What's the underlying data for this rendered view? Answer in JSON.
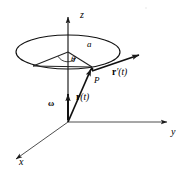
{
  "figure": {
    "background_color": "#ffffff",
    "stroke_color": "#1a1a1a",
    "axes": [
      {
        "key": "z",
        "label": "z",
        "direction": "up",
        "label_x": 80,
        "label_y": 10
      },
      {
        "key": "y",
        "label": "y",
        "direction": "right",
        "label_x": 171,
        "label_y": 127
      },
      {
        "key": "x",
        "label": "x",
        "direction": "lower-left",
        "label_x": 19,
        "label_y": 157
      }
    ],
    "labels": {
      "radius": "a",
      "angle": "θ",
      "point": "P",
      "angular_velocity": "ω",
      "position_vector_bold": "r",
      "position_vector_arg": "(t)",
      "velocity_vector_bold": "r",
      "velocity_vector_prime": "′",
      "velocity_vector_arg": "(t)"
    },
    "label_positions": {
      "radius": {
        "x": 87,
        "y": 44
      },
      "angle": {
        "x": 72,
        "y": 57
      },
      "point": {
        "x": 95,
        "y": 80
      },
      "angular_velocity": {
        "x": 48,
        "y": 101
      },
      "position_vector": {
        "x": 77,
        "y": 96
      },
      "velocity_vector": {
        "x": 113,
        "y": 70
      }
    },
    "geometry": {
      "origin": {
        "x": 68,
        "y": 122
      },
      "circle_center": {
        "x": 68,
        "y": 52
      },
      "circle_rx": 52,
      "circle_ry": 17,
      "point_P": {
        "x": 92,
        "y": 68
      },
      "radius_endpoint": {
        "x": 92,
        "y": 68
      },
      "theta_ray_endpoint": {
        "x": 33,
        "y": 66
      },
      "velocity_arrow_end": {
        "x": 139,
        "y": 55
      },
      "omega_arrow_top": {
        "x": 68,
        "y": 93
      },
      "z_axis_top": {
        "x": 68,
        "y": 16
      },
      "y_axis_end": {
        "x": 168,
        "y": 122
      },
      "x_axis_end": {
        "x": 15,
        "y": 160
      }
    }
  }
}
